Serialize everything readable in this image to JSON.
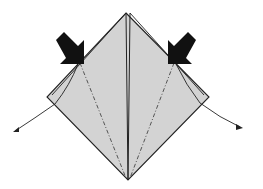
{
  "diagram": {
    "type": "origami-fold-step",
    "paper_color": "#d3d3d3",
    "line_color": "#222222",
    "background": "#ffffff",
    "elements": [
      {
        "name": "square-base",
        "description": "diamond-shaped folded paper"
      },
      {
        "name": "center-crease",
        "description": "vertical center line"
      },
      {
        "name": "left-mountain-fold",
        "description": "dash-dot fold line on left"
      },
      {
        "name": "right-mountain-fold",
        "description": "dash-dot fold line on right"
      },
      {
        "name": "left-push-arrow",
        "description": "black arrow pointing down-right at left edge"
      },
      {
        "name": "right-push-arrow",
        "description": "black arrow pointing down-left at right edge"
      },
      {
        "name": "left-unfold-arrow",
        "description": "curved arrow to the lower left"
      },
      {
        "name": "right-unfold-arrow",
        "description": "curved arrow to the lower right"
      }
    ]
  }
}
